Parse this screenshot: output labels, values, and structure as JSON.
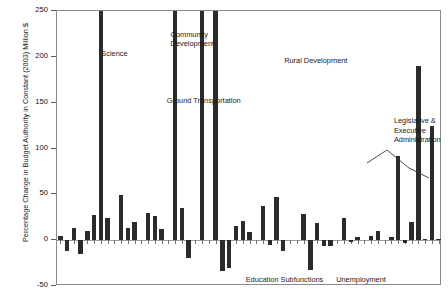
{
  "chart_data": {
    "type": "bar",
    "title": "",
    "subtitle": "",
    "xlabel": "",
    "ylabel": "Percentage Change in Budget Authority in Constant (2003) Million $",
    "ylim": [
      -50,
      250
    ],
    "ytick_values": [
      -50,
      0,
      50,
      100,
      150,
      200,
      250
    ],
    "ytick_labels": [
      "-50",
      "0",
      "50",
      "100",
      "150",
      "200",
      "250"
    ],
    "grid": false,
    "legend": "none",
    "xtick_labels": [],
    "bar_color": "#2b2b2b",
    "note": "Bars are clipped at the 250 top of axis; several exceed the plotted range.",
    "categories": [
      "b1",
      "b2",
      "b3",
      "b4",
      "b5",
      "b6",
      "b7",
      "b8",
      "b9",
      "b10",
      "b11",
      "b12",
      "b13",
      "b14",
      "b15",
      "b16",
      "b17",
      "b18",
      "b19",
      "b20",
      "b21",
      "b22",
      "b23",
      "b24",
      "b25",
      "b26",
      "b27",
      "b28",
      "b29",
      "b30",
      "b31",
      "b32",
      "b33",
      "b34",
      "b35",
      "b36",
      "b37",
      "b38",
      "b39",
      "b40",
      "b41",
      "b42",
      "b43",
      "b44",
      "b45",
      "b46",
      "b47",
      "b48",
      "b49",
      "b50",
      "b51",
      "b52",
      "b53",
      "b54",
      "b55",
      "b56",
      "b57"
    ],
    "values": [
      5,
      -12,
      13,
      -15,
      10,
      27,
      250,
      24,
      0,
      49,
      13,
      20,
      0,
      30,
      26,
      12,
      0,
      250,
      35,
      -20,
      0,
      250,
      0,
      250,
      -34,
      -30,
      16,
      21,
      9,
      0,
      37,
      -5,
      47,
      -12,
      0,
      0,
      29,
      -33,
      19,
      -6,
      -6,
      0,
      24,
      -2,
      3,
      0,
      5,
      10,
      0,
      4,
      92,
      -3,
      20,
      190,
      1,
      125,
      1
    ],
    "annotations": [
      {
        "text": "Science",
        "x": 0.115,
        "y": 203
      },
      {
        "text": "Community\nDevelopment",
        "x": 0.295,
        "y": 224
      },
      {
        "text": "Ground Transportation",
        "x": 0.285,
        "y": 152
      },
      {
        "text": "Rural Development",
        "x": 0.59,
        "y": 196
      },
      {
        "text": "Legislative &\nExecutive\nAdministration",
        "x": 0.875,
        "y": 130
      },
      {
        "text": "Education Subfunctions",
        "x": 0.49,
        "y": -43
      },
      {
        "text": "Unemployment",
        "x": 0.725,
        "y": -43
      }
    ]
  }
}
